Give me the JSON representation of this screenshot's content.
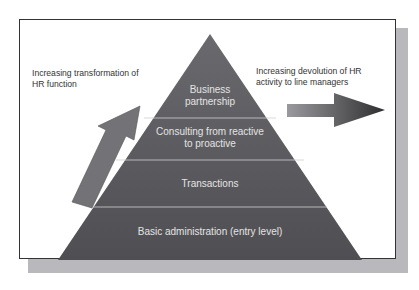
{
  "diagram": {
    "left_label": "Increasing transformation of HR function",
    "left_label_lines": [
      "Increasing transformation of",
      "HR function"
    ],
    "right_label_lines": [
      "Increasing devolution of HR",
      "activity to line managers"
    ],
    "layers": [
      {
        "lines": [
          "Business",
          "partnership"
        ]
      },
      {
        "lines": [
          "Consulting from reactive",
          "to proactive"
        ]
      },
      {
        "lines": [
          "Transactions"
        ]
      },
      {
        "lines": [
          "Basic administration (entry level)"
        ]
      }
    ],
    "colors": {
      "pyramid": "#58585c",
      "arrow": "#6e6e72",
      "text": "#e4e4e4",
      "shadow": "#b9b9bd"
    }
  }
}
